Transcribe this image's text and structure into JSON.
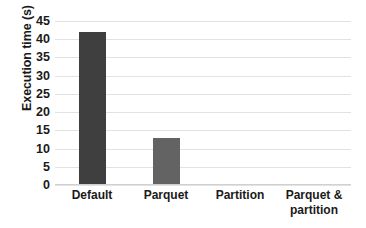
{
  "chart_data": {
    "type": "bar",
    "title": "",
    "subtitle": "",
    "xlabel": "",
    "ylabel": "Execution time (s)",
    "categories": [
      "Default",
      "Parquet",
      "Partition",
      "Parquet & partition"
    ],
    "category_lines": [
      [
        "Default"
      ],
      [
        "Parquet"
      ],
      [
        "Partition"
      ],
      [
        "Parquet &",
        "partition"
      ]
    ],
    "values": [
      42,
      13,
      0.3,
      0.3
    ],
    "ylim": [
      0,
      45
    ],
    "ytick_labels": [
      "0",
      "5",
      "10",
      "15",
      "20",
      "25",
      "30",
      "35",
      "40",
      "45"
    ],
    "ytick_values": [
      0,
      5,
      10,
      15,
      20,
      25,
      30,
      35,
      40,
      45
    ],
    "grid": true,
    "grid_axis": "y",
    "legend": false,
    "legend_position": "none",
    "bar_colors": [
      "#3f3f3f",
      "#636363",
      "#636363",
      "#636363"
    ],
    "gridline_color": "#e2e2e2",
    "axis_color": "#d0d0d0",
    "text_color": "#1a1a1a",
    "background": "#ffffff"
  }
}
